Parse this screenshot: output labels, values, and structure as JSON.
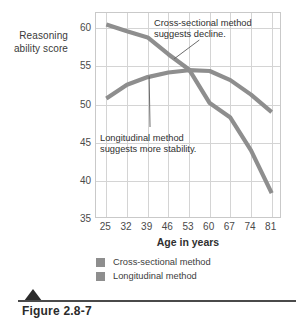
{
  "figure": {
    "caption": "Figure 2.8-7",
    "triangle_icon": "triangle-marker"
  },
  "chart_data": {
    "type": "line",
    "title": "",
    "xlabel": "Age in years",
    "ylabel": "Reasoning ability score",
    "x": [
      25,
      32,
      39,
      46,
      53,
      60,
      67,
      74,
      81
    ],
    "xticklabels": [
      "25",
      "32",
      "39",
      "46",
      "53",
      "60",
      "67",
      "74",
      "81"
    ],
    "yticklabels": [
      "60",
      "55",
      "50",
      "45",
      "40",
      "35"
    ],
    "yticks": [
      60,
      55,
      50,
      45,
      40,
      35
    ],
    "ylim": [
      35,
      62
    ],
    "xlim": [
      21.5,
      84.5
    ],
    "grid": true,
    "legend_position": "below-axes",
    "series": [
      {
        "name": "Cross-sectional method",
        "color": "#8e8e8e",
        "values": [
          60.5,
          59.6,
          58.8,
          56.6,
          54.6,
          50.2,
          48.3,
          44.0,
          38.4
        ]
      },
      {
        "name": "Longitudinal method",
        "color": "#8e8e8e",
        "values": [
          50.8,
          52.6,
          53.6,
          54.2,
          54.5,
          54.4,
          53.2,
          51.3,
          49.0
        ]
      }
    ],
    "annotations": [
      {
        "id": "cross-sectional-note",
        "text": "Cross-sectional method suggests decline.",
        "points_to_x": 48,
        "points_to_y": 56.0
      },
      {
        "id": "longitudinal-note",
        "text": "Longitudinal method suggests more stability.",
        "points_to_x": 39.5,
        "points_to_y": 53.7
      }
    ]
  },
  "legend": {
    "items": [
      {
        "label": "Cross-sectional method",
        "color": "#8e8e8e"
      },
      {
        "label": "Longitudinal method",
        "color": "#8e8e8e"
      }
    ]
  },
  "colors": {
    "series_gray": "#8e8e8e",
    "grid": "#d4d4d4",
    "frame": "#c9c9c9",
    "text": "#3b3b3b",
    "caption": "#2b2b2b"
  }
}
